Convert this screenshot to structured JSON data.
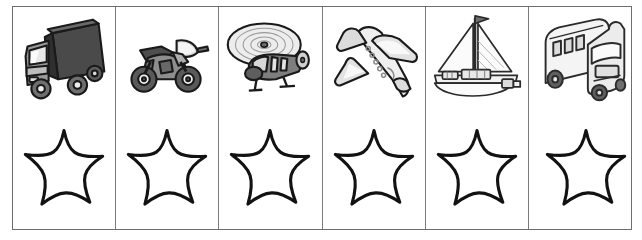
{
  "worksheet": {
    "title": "Vehicles and stars matching worksheet",
    "columns": 6,
    "rows": 2,
    "border_color": "#6e6e6e",
    "divider_color": "#7a7a7a",
    "background_color": "#ffffff",
    "ink_color": "#1a1a1a"
  },
  "row_labels": {
    "top": "vehicle pictures",
    "bottom": "star outlines"
  },
  "items": [
    {
      "index": 1,
      "vehicle_name": "truck-icon",
      "vehicle_label": "truck",
      "star_name": "star-outline-1",
      "star_label": "star",
      "fill_dark": "#4a4a4a",
      "fill_mid": "#8c8c8c",
      "fill_light": "#d6d6d6"
    },
    {
      "index": 2,
      "vehicle_name": "motorcycle-icon",
      "vehicle_label": "motorcycle",
      "star_name": "star-outline-2",
      "star_label": "star",
      "fill_dark": "#4f4f4f",
      "fill_mid": "#8f8f8f",
      "fill_light": "#d8d8d8"
    },
    {
      "index": 3,
      "vehicle_name": "helicopter-icon",
      "vehicle_label": "helicopter",
      "star_name": "star-outline-3",
      "star_label": "star",
      "fill_dark": "#555555",
      "fill_mid": "#949494",
      "fill_light": "#e2e2e2"
    },
    {
      "index": 4,
      "vehicle_name": "airplane-icon",
      "vehicle_label": "airplane",
      "star_name": "star-outline-4",
      "star_label": "star",
      "fill_dark": "#6a6a6a",
      "fill_mid": "#bdbdbd",
      "fill_light": "#f0f0f0"
    },
    {
      "index": 5,
      "vehicle_name": "sailboat-icon",
      "vehicle_label": "sailboat",
      "star_name": "star-outline-5",
      "star_label": "star",
      "fill_dark": "#707070",
      "fill_mid": "#c4c4c4",
      "fill_light": "#f4f4f4"
    },
    {
      "index": 6,
      "vehicle_name": "bus-icon",
      "vehicle_label": "bus",
      "star_name": "star-outline-6",
      "star_label": "star",
      "fill_dark": "#6d6d6d",
      "fill_mid": "#c0c0c0",
      "fill_light": "#f2f2f2"
    }
  ]
}
